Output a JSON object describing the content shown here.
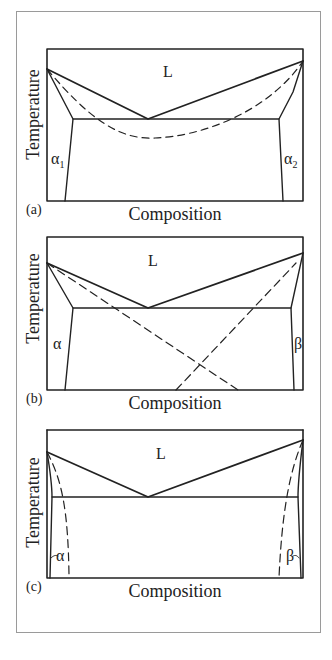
{
  "figure": {
    "panels": [
      {
        "id": "a",
        "letter": "(a)",
        "ylabel": "Temperature",
        "xlabel": "Composition",
        "liquid_label": "L",
        "left_phase": {
          "symbol": "α",
          "sub": "1"
        },
        "right_phase": {
          "symbol": "α",
          "sub": "2"
        },
        "description": "Eutectic phase diagram with dashed miscibility curve below eutectic"
      },
      {
        "id": "b",
        "letter": "(b)",
        "ylabel": "Temperature",
        "xlabel": "Composition",
        "liquid_label": "L",
        "left_phase": {
          "symbol": "α",
          "sub": ""
        },
        "right_phase": {
          "symbol": "β",
          "sub": ""
        },
        "description": "Eutectic phase diagram with two crossing dashed lines"
      },
      {
        "id": "c",
        "letter": "(c)",
        "ylabel": "Temperature",
        "xlabel": "Composition",
        "liquid_label": "L",
        "left_phase": {
          "symbol": "α",
          "sub": ""
        },
        "right_phase": {
          "symbol": "β",
          "sub": ""
        },
        "description": "Eutectic phase diagram with narrow terminal solid solutions and dashed curves near edges"
      }
    ]
  }
}
